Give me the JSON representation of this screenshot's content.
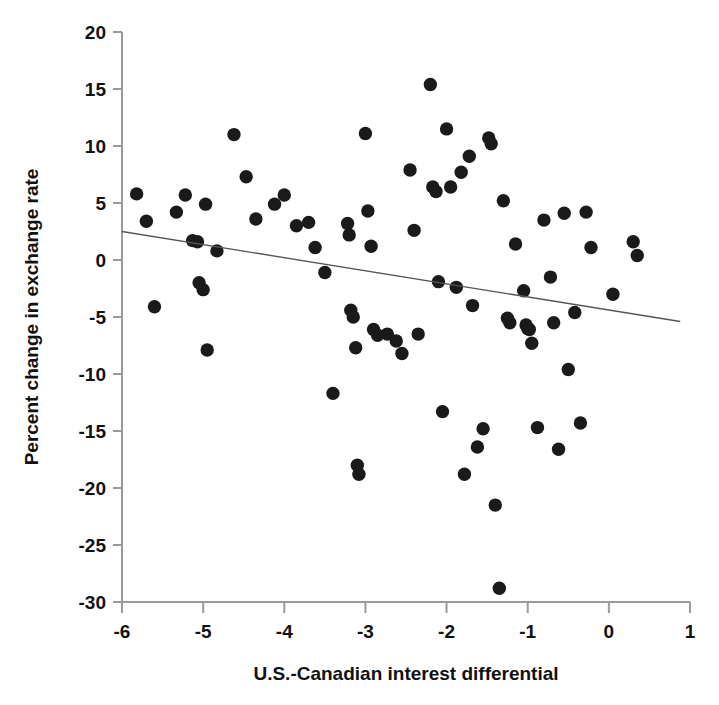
{
  "chart_data": {
    "type": "scatter",
    "title": "",
    "xlabel": "U.S.-Canadian interest differential",
    "ylabel": "Percent change in exchange rate",
    "xlim": [
      -6,
      1
    ],
    "ylim": [
      -30,
      20
    ],
    "xticks": [
      -6,
      -5,
      -4,
      -3,
      -2,
      -1,
      0,
      1
    ],
    "xtick_labels": [
      "-6",
      "-5",
      "-4",
      "-3",
      "-2",
      "-1",
      "0",
      "1"
    ],
    "yticks": [
      -30,
      -25,
      -20,
      -15,
      -10,
      -5,
      0,
      5,
      10,
      15,
      20
    ],
    "ytick_labels": [
      "-30",
      "-25",
      "-20",
      "-15",
      "-10",
      "-5",
      "0",
      "5",
      "10",
      "15",
      "20"
    ],
    "grid": false,
    "legend": null,
    "marker": "filled-circle",
    "marker_color": "#1a1a1a",
    "marker_size": 9,
    "trend_line": {
      "label": "fitted regression line",
      "x": [
        -6.0,
        0.88
      ],
      "y": [
        2.5,
        -5.4
      ],
      "color": "#555555"
    },
    "points": [
      {
        "x": -5.82,
        "y": 5.8
      },
      {
        "x": -5.7,
        "y": 3.4
      },
      {
        "x": -5.6,
        "y": -4.1
      },
      {
        "x": -5.33,
        "y": 4.2
      },
      {
        "x": -5.22,
        "y": 5.7
      },
      {
        "x": -5.13,
        "y": 1.7
      },
      {
        "x": -5.07,
        "y": 1.6
      },
      {
        "x": -5.05,
        "y": -2.0
      },
      {
        "x": -5.0,
        "y": -2.6
      },
      {
        "x": -4.97,
        "y": 4.9
      },
      {
        "x": -4.95,
        "y": -7.9
      },
      {
        "x": -4.83,
        "y": 0.8
      },
      {
        "x": -4.62,
        "y": 11.0
      },
      {
        "x": -4.47,
        "y": 7.3
      },
      {
        "x": -4.35,
        "y": 3.6
      },
      {
        "x": -4.12,
        "y": 4.9
      },
      {
        "x": -4.0,
        "y": 5.7
      },
      {
        "x": -3.85,
        "y": 3.0
      },
      {
        "x": -3.7,
        "y": 3.3
      },
      {
        "x": -3.62,
        "y": 1.1
      },
      {
        "x": -3.5,
        "y": -1.1
      },
      {
        "x": -3.4,
        "y": -11.7
      },
      {
        "x": -3.22,
        "y": 3.2
      },
      {
        "x": -3.2,
        "y": 2.2
      },
      {
        "x": -3.18,
        "y": -4.4
      },
      {
        "x": -3.15,
        "y": -5.0
      },
      {
        "x": -3.12,
        "y": -7.7
      },
      {
        "x": -3.1,
        "y": -18.0
      },
      {
        "x": -3.08,
        "y": -18.8
      },
      {
        "x": -3.0,
        "y": 11.1
      },
      {
        "x": -2.97,
        "y": 4.3
      },
      {
        "x": -2.93,
        "y": 1.2
      },
      {
        "x": -2.9,
        "y": -6.1
      },
      {
        "x": -2.85,
        "y": -6.6
      },
      {
        "x": -2.73,
        "y": -6.5
      },
      {
        "x": -2.62,
        "y": -7.1
      },
      {
        "x": -2.55,
        "y": -8.2
      },
      {
        "x": -2.45,
        "y": 7.9
      },
      {
        "x": -2.4,
        "y": 2.6
      },
      {
        "x": -2.35,
        "y": -6.5
      },
      {
        "x": -2.2,
        "y": 15.4
      },
      {
        "x": -2.17,
        "y": 6.4
      },
      {
        "x": -2.13,
        "y": 6.0
      },
      {
        "x": -2.1,
        "y": -1.9
      },
      {
        "x": -2.05,
        "y": -13.3
      },
      {
        "x": -2.0,
        "y": 11.5
      },
      {
        "x": -1.95,
        "y": 6.4
      },
      {
        "x": -1.88,
        "y": -2.4
      },
      {
        "x": -1.82,
        "y": 7.7
      },
      {
        "x": -1.78,
        "y": -18.8
      },
      {
        "x": -1.72,
        "y": 9.1
      },
      {
        "x": -1.68,
        "y": -4.0
      },
      {
        "x": -1.62,
        "y": -16.4
      },
      {
        "x": -1.55,
        "y": -14.8
      },
      {
        "x": -1.48,
        "y": 10.7
      },
      {
        "x": -1.45,
        "y": 10.2
      },
      {
        "x": -1.4,
        "y": -21.5
      },
      {
        "x": -1.35,
        "y": -28.8
      },
      {
        "x": -1.3,
        "y": 5.2
      },
      {
        "x": -1.25,
        "y": -5.1
      },
      {
        "x": -1.22,
        "y": -5.5
      },
      {
        "x": -1.15,
        "y": 1.4
      },
      {
        "x": -1.05,
        "y": -2.7
      },
      {
        "x": -1.02,
        "y": -5.7
      },
      {
        "x": -1.0,
        "y": -6.0
      },
      {
        "x": -0.98,
        "y": -6.1
      },
      {
        "x": -0.95,
        "y": -7.3
      },
      {
        "x": -0.88,
        "y": -14.7
      },
      {
        "x": -0.8,
        "y": 3.5
      },
      {
        "x": -0.72,
        "y": -1.5
      },
      {
        "x": -0.68,
        "y": -5.5
      },
      {
        "x": -0.62,
        "y": -16.6
      },
      {
        "x": -0.55,
        "y": 4.1
      },
      {
        "x": -0.5,
        "y": -9.6
      },
      {
        "x": -0.42,
        "y": -4.6
      },
      {
        "x": -0.35,
        "y": -14.3
      },
      {
        "x": -0.28,
        "y": 4.2
      },
      {
        "x": -0.22,
        "y": 1.1
      },
      {
        "x": 0.05,
        "y": -3.0
      },
      {
        "x": 0.3,
        "y": 1.6
      },
      {
        "x": 0.35,
        "y": 0.4
      }
    ]
  }
}
